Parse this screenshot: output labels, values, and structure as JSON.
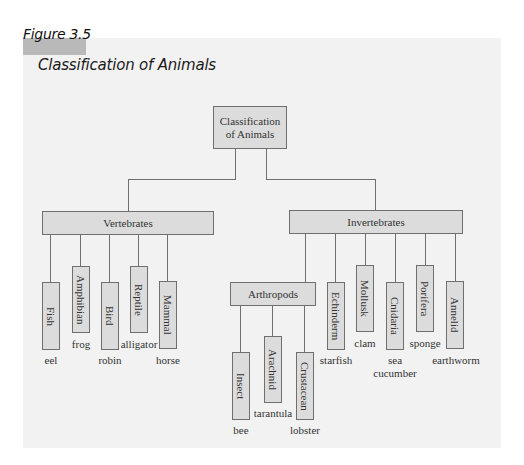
{
  "figure": {
    "label": "Figure 3.5",
    "title": "Classification of Animals"
  },
  "root": {
    "label": "Classification of Animals",
    "line1": "Classification",
    "line2": "of Animals"
  },
  "vertebrates": {
    "label": "Vertebrates",
    "children": [
      {
        "label": "Fish",
        "example": "eel"
      },
      {
        "label": "Amphibian",
        "example": "frog"
      },
      {
        "label": "Bird",
        "example": "robin"
      },
      {
        "label": "Reptile",
        "example": "alligator"
      },
      {
        "label": "Mammal",
        "example": "horse"
      }
    ]
  },
  "invertebrates": {
    "label": "Invertebrates",
    "arthropods": {
      "label": "Arthropods",
      "children": [
        {
          "label": "Insect",
          "example": "bee"
        },
        {
          "label": "Arachnid",
          "example": "tarantula"
        },
        {
          "label": "Crustacean",
          "example": "lobster"
        }
      ]
    },
    "children": [
      {
        "label": "Echinderm",
        "example": "starfish"
      },
      {
        "label": "Mollusk",
        "example": "clam"
      },
      {
        "label": "Cnidaria",
        "example_line1": "sea",
        "example_line2": "cucumber"
      },
      {
        "label": "Porifera",
        "example": "sponge"
      },
      {
        "label": "Annelid",
        "example": "earthworm"
      }
    ]
  },
  "colors": {
    "panel": "#f2f2f2",
    "box_fill": "#dcdcdc",
    "line": "#6f6f6f",
    "figure_bar": "#b9b9b9"
  }
}
